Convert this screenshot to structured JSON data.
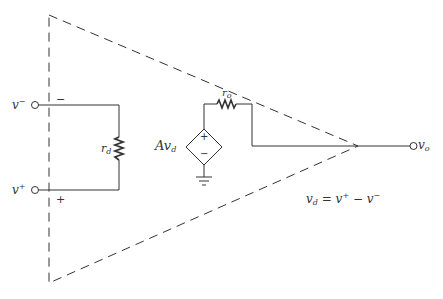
{
  "diagram": {
    "labels": {
      "v_minus": {
        "base": "v",
        "sup": "−"
      },
      "v_plus": {
        "base": "v",
        "sup": "+"
      },
      "r_d": {
        "base": "r",
        "sub": "d"
      },
      "r_o": {
        "base": "r",
        "sub": "o"
      },
      "source": {
        "base": "Av",
        "sub": "d"
      },
      "v_o": {
        "base": "v",
        "sub": "o"
      },
      "minus_sign": "−",
      "plus_sign": "+",
      "source_plus": "+",
      "source_minus": "−"
    },
    "equation": {
      "lhs": "v",
      "lhs_sub": "d",
      "rhs": "= v",
      "rhs_sup1": "+",
      "mid": " − v",
      "rhs_sup2": "−"
    },
    "colors": {
      "line": "#333333",
      "background": "#ffffff"
    }
  }
}
